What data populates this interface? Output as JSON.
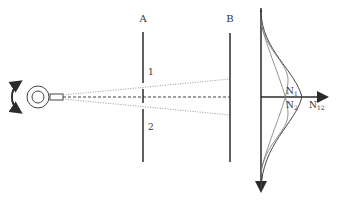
{
  "diagram": {
    "labels": {
      "barrier_a": "A",
      "barrier_b": "B",
      "slit_1": "1",
      "slit_2": "2",
      "n1": "N",
      "n1_sub": "1",
      "n2": "N",
      "n2_sub": "2",
      "n12": "N",
      "n12_sub": "12"
    },
    "colors": {
      "line": "#2b2b2b",
      "curve_light": "#777777",
      "ray": "#999999"
    }
  }
}
